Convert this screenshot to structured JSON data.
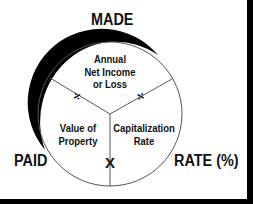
{
  "diagram": {
    "type": "circle-formula-triangle",
    "outer_labels": {
      "top": "MADE",
      "left": "PAID",
      "right": "RATE (%)"
    },
    "sectors": {
      "top": {
        "line1": "Annual",
        "line2": "Net Income",
        "line3": "or Loss"
      },
      "bottom_left": {
        "line1": "Value of",
        "line2": "Property"
      },
      "bottom_right": {
        "line1": "Capitalization",
        "line2": "Rate"
      }
    },
    "operators": {
      "left_divider": "÷",
      "right_divider": "÷",
      "bottom_divider": "X"
    },
    "colors": {
      "stroke": "#555555",
      "arc": "#000000",
      "text": "#111111",
      "border": "#000000"
    }
  }
}
